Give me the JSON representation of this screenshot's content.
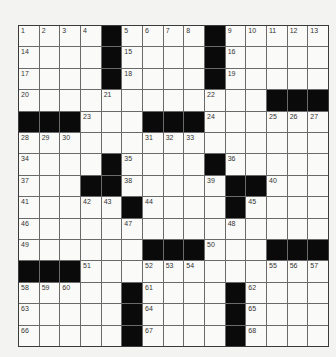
{
  "puzzle": {
    "rows": 15,
    "cols": 15,
    "colors": {
      "background": "#f3f3f1",
      "cell": "#fafaf8",
      "block": "#0a0a0a",
      "gridline": "#6a6a6a"
    },
    "layout": [
      "1 2 3 4 # 5 6 7 8 # 9 10 11 12 13",
      "14 . . . # 15 . . . # 16 . . . .",
      "17 . . . # 18 . . . # 19 . . . .",
      "20 . . . 21 . . . . 22 . . # # #",
      "# # # 23 . . # # # 24 . . 25 26 27",
      "28 29 30 . . . 31 32 33 . . . . . .",
      "34 . . . # 35 . . . # 36 . . . .",
      "37 . . # # 38 . . . 39 # # 40 . .",
      "41 . . 42 43 # 44 . . . # 45 . . .",
      "46 . . . . 47 . . . . 48 . . . .",
      "49 . . . . . # # # 50 . . # # #",
      "# # # 51 . . 52 53 54 . . . 55 56 57",
      "58 59 60 . . # 61 . . . # 62 . . .",
      "63 . . . . # 64 . . . # 65 . . .",
      "66 . . . . # 67 . . . # 68 . . ."
    ]
  }
}
